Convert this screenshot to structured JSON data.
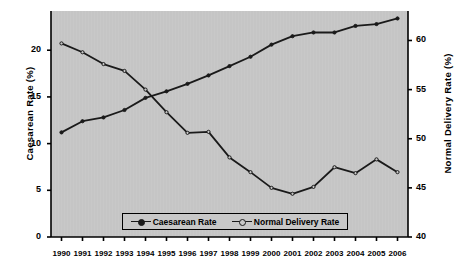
{
  "chart_data": {
    "type": "line",
    "title": "",
    "xlabel": "",
    "ylabel": "Caesarean Rate (%)",
    "y2label": "Normal Delivery Rate (%)",
    "grid": false,
    "legend_position": "bottom-center",
    "categories": [
      "1990",
      "1991",
      "1992",
      "1993",
      "1994",
      "1995",
      "1996",
      "1997",
      "1998",
      "1999",
      "2000",
      "2001",
      "2002",
      "2003",
      "2004",
      "2005",
      "2006"
    ],
    "x": [
      1990,
      1991,
      1992,
      1993,
      1994,
      1995,
      1996,
      1997,
      1998,
      1999,
      2000,
      2001,
      2002,
      2003,
      2004,
      2005,
      2006
    ],
    "ylim": [
      0,
      24.2
    ],
    "yticks": [
      0,
      5,
      10,
      15,
      20
    ],
    "y2lim": [
      40,
      63.0
    ],
    "y2ticks": [
      40,
      45,
      50,
      55,
      60
    ],
    "series": [
      {
        "name": "Caesarean Rate",
        "axis": "left",
        "units": "%",
        "marker": "filled-circle",
        "color": "#1a1a1a",
        "values": [
          11.2,
          12.4,
          12.8,
          13.6,
          14.9,
          15.6,
          16.4,
          17.3,
          18.3,
          19.3,
          20.6,
          21.5,
          21.9,
          21.9,
          22.6,
          22.8,
          23.4
        ]
      },
      {
        "name": "Normal Delivery Rate",
        "axis": "right",
        "units": "%",
        "marker": "open-circle",
        "color": "#1a1a1a",
        "values": [
          59.7,
          58.8,
          57.6,
          56.9,
          55.0,
          52.7,
          50.6,
          50.7,
          48.1,
          46.6,
          45.0,
          44.4,
          45.1,
          47.1,
          46.5,
          47.9,
          46.6
        ]
      }
    ],
    "legend": [
      {
        "label": "Caesarean Rate",
        "marker": "filled-circle"
      },
      {
        "label": "Normal Delivery Rate",
        "marker": "open-circle"
      }
    ],
    "annotations": []
  },
  "figure": {
    "plot_background": "#c8c8c8",
    "page_background": "#ffffff",
    "axis_color": "#000000",
    "line_color": "#1a1a1a"
  }
}
